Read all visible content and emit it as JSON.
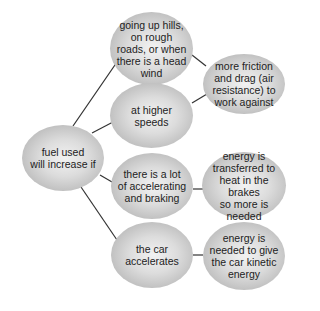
{
  "diagram": {
    "type": "mind-map",
    "line_color": "#333333",
    "node_fill_center": "#f2f2f2",
    "node_fill_edge": "#a9a9a9",
    "root": {
      "id": "fuel",
      "label": "fuel used\nwill increase if"
    },
    "conditions": [
      {
        "id": "hills",
        "label": "going up hills,\non rough\nroads, or when\nthere is a head\nwind"
      },
      {
        "id": "speeds",
        "label": "at higher speeds"
      },
      {
        "id": "braking",
        "label": "there is a lot\nof accelerating\nand braking"
      },
      {
        "id": "accelerates",
        "label": "the car\naccelerates"
      }
    ],
    "reasons": [
      {
        "id": "friction",
        "label": "more friction\nand drag (air\nresistance) to\nwork against",
        "from": [
          "hills",
          "speeds"
        ]
      },
      {
        "id": "heat",
        "label": "energy is\ntransferred to\nheat in the brakes\nso more is\nneeded",
        "from": [
          "braking"
        ]
      },
      {
        "id": "kinetic",
        "label": "energy is\nneeded to give\nthe car kinetic\nenergy",
        "from": [
          "accelerates"
        ]
      }
    ]
  }
}
